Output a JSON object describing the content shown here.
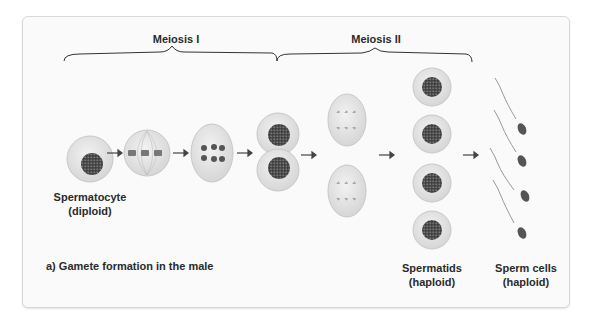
{
  "phases": {
    "meiosis_1": "Meiosis I",
    "meiosis_2": "Meiosis II"
  },
  "labels": {
    "spermatocyte_line1": "Spermatocyte",
    "spermatocyte_line2": "(diploid)",
    "spermatids_line1": "Spermatids",
    "spermatids_line2": "(haploid)",
    "sperm_line1": "Sperm cells",
    "sperm_line2": "(haploid)",
    "caption": "a) Gamete formation in the male"
  },
  "colors": {
    "cell_fill": "#e6e6e6",
    "cell_edge": "#c4c4c4",
    "nucleus": "#4a4a4a",
    "arrow": "#444444",
    "text": "#2b2b2b"
  }
}
